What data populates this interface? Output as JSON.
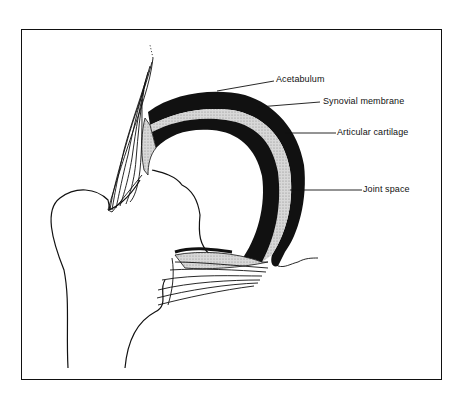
{
  "diagram": {
    "colors": {
      "ink": "#111111",
      "stipple": "#c8c8c8",
      "background": "#ffffff"
    },
    "labels": [
      {
        "id": "acetabulum",
        "text": "Acetabulum"
      },
      {
        "id": "synovial-membrane",
        "text": "Synovial membrane"
      },
      {
        "id": "articular-cartilage",
        "text": "Articular cartilage"
      },
      {
        "id": "joint-space",
        "text": "Joint space"
      }
    ]
  }
}
